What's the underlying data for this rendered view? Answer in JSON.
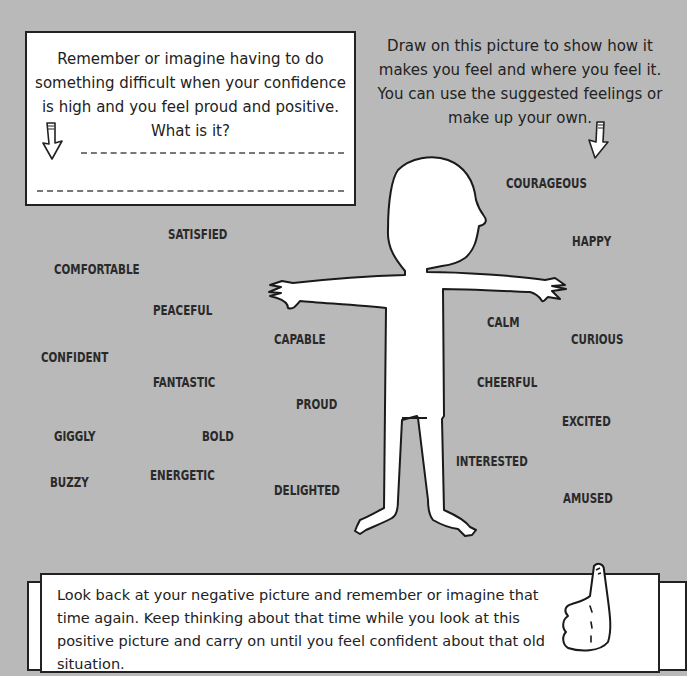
{
  "top_box": {
    "prompt": "Remember or imagine having to do something difficult when your confidence is high and you feel proud and positive. What is it?",
    "answer_lines": 2
  },
  "instructions": {
    "text": "Draw on this picture to show how it makes you feel and where you feel it. You can use the suggested feelings or make up your own."
  },
  "figure": {
    "icon": "person-outline-figure"
  },
  "feelings": [
    {
      "label": "SATISFIED",
      "x": 168,
      "y": 233
    },
    {
      "label": "COMFORTABLE",
      "x": 54,
      "y": 268
    },
    {
      "label": "PEACEFUL",
      "x": 153,
      "y": 309
    },
    {
      "label": "CONFIDENT",
      "x": 41,
      "y": 356
    },
    {
      "label": "FANTASTIC",
      "x": 153,
      "y": 381
    },
    {
      "label": "GIGGLY",
      "x": 54,
      "y": 435
    },
    {
      "label": "BOLD",
      "x": 202,
      "y": 435
    },
    {
      "label": "BUZZY",
      "x": 50,
      "y": 481
    },
    {
      "label": "ENERGETIC",
      "x": 150,
      "y": 474
    },
    {
      "label": "CAPABLE",
      "x": 274,
      "y": 338
    },
    {
      "label": "PROUD",
      "x": 296,
      "y": 403
    },
    {
      "label": "DELIGHTED",
      "x": 274,
      "y": 489
    },
    {
      "label": "COURAGEOUS",
      "x": 506,
      "y": 182
    },
    {
      "label": "HAPPY",
      "x": 572,
      "y": 240
    },
    {
      "label": "CALM",
      "x": 487,
      "y": 321
    },
    {
      "label": "CURIOUS",
      "x": 571,
      "y": 338
    },
    {
      "label": "CHEERFUL",
      "x": 477,
      "y": 381
    },
    {
      "label": "EXCITED",
      "x": 562,
      "y": 420
    },
    {
      "label": "INTERESTED",
      "x": 456,
      "y": 460
    },
    {
      "label": "AMUSED",
      "x": 563,
      "y": 497
    }
  ],
  "bottom_box": {
    "text": "Look back at your negative picture and remember or imagine that time again. Keep thinking about that time while you look at this positive picture and carry on until you feel confident about that old situation.",
    "icon": "thumbs-up-icon"
  }
}
